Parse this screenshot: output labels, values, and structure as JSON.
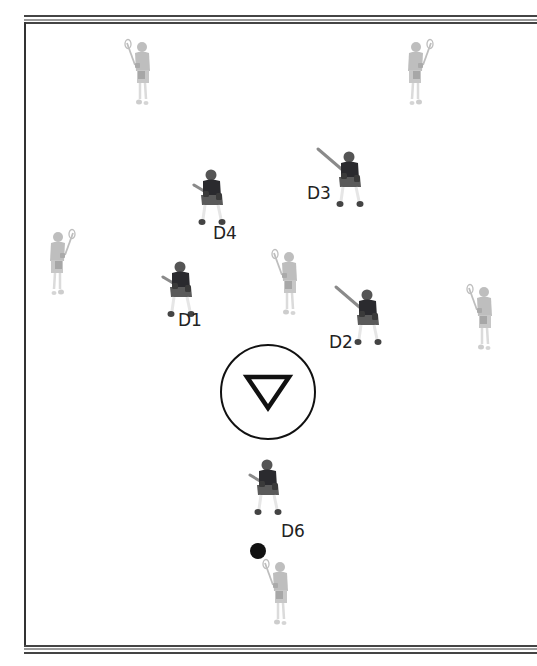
{
  "diagram": {
    "type": "lacrosse-defense-formation",
    "colors": {
      "defender": "#2a2a2e",
      "defender_shorts": "#5a5a5a",
      "attacker": "#a9a9a9",
      "border_dark": "#333333",
      "border_light": "#9a9a9a",
      "ball": "#111111",
      "crease": "#111111"
    },
    "defenders": [
      {
        "id": "D1",
        "label": "D1",
        "x": 181,
        "y": 292,
        "label_x": 178,
        "label_y": 321
      },
      {
        "id": "D2",
        "label": "D2",
        "x": 368,
        "y": 320,
        "label_x": 329,
        "label_y": 343
      },
      {
        "id": "D3",
        "label": "D3",
        "x": 350,
        "y": 182,
        "label_x": 307,
        "label_y": 194
      },
      {
        "id": "D4",
        "label": "D4",
        "x": 212,
        "y": 200,
        "label_x": 213,
        "label_y": 234
      },
      {
        "id": "D6",
        "label": "D6",
        "x": 268,
        "y": 490,
        "label_x": 281,
        "label_y": 532
      }
    ],
    "attackers": [
      {
        "id": "A-top-left",
        "x": 140,
        "y": 75,
        "stick_side": "left"
      },
      {
        "id": "A-top-right",
        "x": 418,
        "y": 75,
        "stick_side": "right"
      },
      {
        "id": "A-left-wing",
        "x": 60,
        "y": 265,
        "stick_side": "right"
      },
      {
        "id": "A-center",
        "x": 287,
        "y": 285,
        "stick_side": "left"
      },
      {
        "id": "A-right-wing",
        "x": 482,
        "y": 320,
        "stick_side": "left"
      },
      {
        "id": "A-bottom-ball",
        "x": 278,
        "y": 595,
        "stick_side": "left"
      }
    ],
    "goal": {
      "symbol": "inverted-triangle",
      "center_x": 268,
      "center_y": 392,
      "radius": 48
    },
    "ball": {
      "x": 258,
      "y": 551,
      "radius": 8
    }
  }
}
